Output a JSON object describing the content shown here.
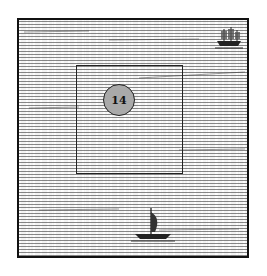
{
  "map": {
    "style": "engraved-sea",
    "colors": {
      "border": "#111111",
      "sea_background": "#f4f4f4",
      "marker_fill": "#a9a9a9"
    },
    "marker": {
      "label": "14"
    },
    "icons": [
      {
        "name": "galleon-ship-icon",
        "position": "top-right"
      },
      {
        "name": "sailboat-icon",
        "position": "bottom-center"
      }
    ]
  }
}
